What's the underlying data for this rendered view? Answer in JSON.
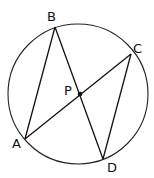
{
  "diagram": {
    "circle": {
      "cx": 78,
      "cy": 94,
      "r": 70
    },
    "points": {
      "A": {
        "x": 25,
        "y": 139,
        "label": "A",
        "lx": 12,
        "ly": 148
      },
      "B": {
        "x": 55,
        "y": 27,
        "label": "B",
        "lx": 47,
        "ly": 21
      },
      "C": {
        "x": 131,
        "y": 54,
        "label": "C",
        "lx": 133,
        "ly": 53
      },
      "D": {
        "x": 103,
        "y": 159,
        "label": "D",
        "lx": 107,
        "ly": 172
      },
      "P": {
        "x": 80,
        "y": 94,
        "label": "P",
        "lx": 64,
        "ly": 95
      }
    },
    "segments": [
      [
        "A",
        "B"
      ],
      [
        "B",
        "D"
      ],
      [
        "A",
        "C"
      ],
      [
        "C",
        "D"
      ]
    ]
  }
}
